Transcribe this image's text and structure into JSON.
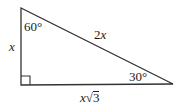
{
  "diagram": {
    "type": "right-triangle",
    "vertices": {
      "top": [
        21,
        8
      ],
      "right_angle": [
        21,
        85
      ],
      "right": [
        173,
        84
      ]
    },
    "right_angle_marker_size": 9,
    "stroke_color": "#333333",
    "angles": {
      "top": "60°",
      "right": "30°",
      "bottom_left": "90°"
    },
    "sides": {
      "left": {
        "variable": "x"
      },
      "hypotenuse": {
        "coefficient": "2",
        "variable": "x"
      },
      "bottom": {
        "variable": "x",
        "radical": "√",
        "radicand": "3"
      }
    }
  }
}
